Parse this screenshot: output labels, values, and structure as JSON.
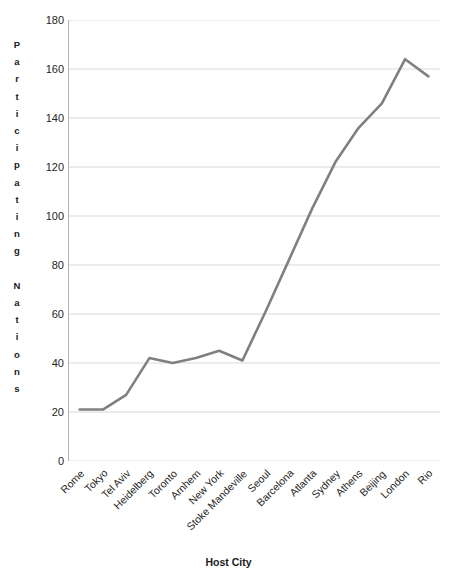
{
  "chart_data": {
    "type": "line",
    "title": "",
    "xlabel": "Host City",
    "ylabel": "Participating Nations",
    "categories": [
      "Rome",
      "Tokyo",
      "Tel Aviv",
      "Heidelberg",
      "Toronto",
      "Arnhem",
      "New York",
      "Stoke Mandeville",
      "Seoul",
      "Barcelona",
      "Atlanta",
      "Sydney",
      "Athens",
      "Beijing",
      "London",
      "Rio"
    ],
    "values": [
      21,
      21,
      27,
      42,
      40,
      42,
      45,
      41,
      61,
      82,
      103,
      122,
      136,
      146,
      164,
      157
    ],
    "ylim": [
      0,
      180
    ],
    "yticks": [
      0,
      20,
      40,
      60,
      80,
      100,
      120,
      140,
      160,
      180
    ],
    "ytick_labels": [
      "0",
      "20",
      "40",
      "60",
      "80",
      "100",
      "120",
      "140",
      "160",
      "180"
    ],
    "grid": true,
    "legend": false,
    "series_color": "#808080",
    "grid_color": "#d9d9d9",
    "axis_color": "#b3b3b3",
    "line_width": 2.6
  },
  "axes": {
    "y_title_letters": "P\na\nr\nt\ni\nc\ni\np\na\nt\ni\nn\ng\n\nN\na\nt\ni\no\nn\ns",
    "x_title": "Host City"
  }
}
